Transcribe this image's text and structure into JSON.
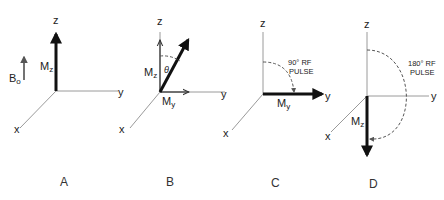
{
  "figure": {
    "field_label": {
      "main": "B",
      "sub": "o"
    },
    "panels": [
      {
        "id": "A",
        "label": "A",
        "axes": {
          "z": "z",
          "y": "y",
          "x": "x"
        },
        "vectors": [
          {
            "label_main": "M",
            "label_sub": "z",
            "direction": "up"
          }
        ]
      },
      {
        "id": "B",
        "label": "B",
        "axes": {
          "z": "z",
          "y": "y",
          "x": "x"
        },
        "angle_label": "θ",
        "vectors": [
          {
            "label_main": "M",
            "label_sub": "z",
            "direction": "up"
          },
          {
            "label_main": "M",
            "label_sub": "y",
            "direction": "right"
          },
          {
            "label_main": "",
            "label_sub": "",
            "direction": "tilted"
          }
        ]
      },
      {
        "id": "C",
        "label": "C",
        "axes": {
          "z": "z",
          "y": "y",
          "x": "x"
        },
        "pulse_label_line1": "90° RF",
        "pulse_label_line2": "PULSE",
        "vectors": [
          {
            "label_main": "M",
            "label_sub": "y",
            "direction": "right"
          }
        ]
      },
      {
        "id": "D",
        "label": "D",
        "axes": {
          "z": "z",
          "y": "y",
          "x": "x"
        },
        "pulse_label_line1": "180° RF",
        "pulse_label_line2": "PULSE",
        "vectors": [
          {
            "label_main": "M",
            "label_sub": "z",
            "direction": "down"
          }
        ]
      }
    ]
  }
}
